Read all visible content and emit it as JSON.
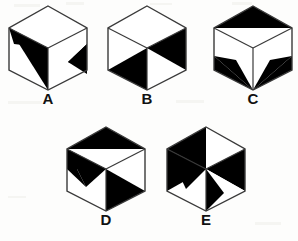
{
  "figure": {
    "background_color": "#fdfdfc",
    "ink_color": "#000000",
    "outline_color": "#3a3a3a",
    "face_fill_color": "#ffffff",
    "option_count": 5
  },
  "options": [
    {
      "id": "A",
      "label": "A",
      "row": 1,
      "column": 1,
      "description": "Cube with black triangle on upper-left of left face running to bottom vertex, and a black wedge pointing left on the right face",
      "shaded_faces": [
        "left-face",
        "right-face"
      ]
    },
    {
      "id": "B",
      "label": "B",
      "row": 1,
      "column": 2,
      "description": "Cube with black upper triangle on right face and black left triangle on bottom-left face",
      "shaded_faces": [
        "right-face",
        "left-face"
      ]
    },
    {
      "id": "C",
      "label": "C",
      "row": 1,
      "column": 3,
      "description": "Cube with black upper triangle on top face and black lower wedges on both left and right faces",
      "shaded_faces": [
        "top-face",
        "left-face",
        "right-face"
      ]
    },
    {
      "id": "D",
      "label": "D",
      "row": 2,
      "column": 1,
      "description": "Cube with black upper triangle on top face, black upper triangle on left face, and black lower triangle on right face",
      "shaded_faces": [
        "top-face",
        "left-face",
        "right-face"
      ]
    },
    {
      "id": "E",
      "label": "E",
      "row": 2,
      "column": 2,
      "description": "Cube with black left triangle on top face, black upper triangle on left face, and black upper-right triangle on right face",
      "shaded_faces": [
        "top-face",
        "left-face",
        "right-face"
      ]
    }
  ]
}
